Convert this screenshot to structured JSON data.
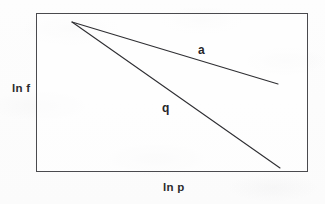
{
  "figure": {
    "type": "line-diagram",
    "background_color": "#fdfdfd",
    "frame_color": "#4a4a4e",
    "line_color": "#2e2e32"
  },
  "axes": {
    "y_label": "ln f",
    "x_label": "ln p"
  },
  "chart_data": {
    "type": "line",
    "title": "",
    "xlabel": "ln p",
    "ylabel": "ln f",
    "grid": false,
    "legend": "inline-labels",
    "axis_ticks": false,
    "frame": {
      "x0": 36,
      "y0": 13,
      "x1": 308,
      "y1": 172
    },
    "series": [
      {
        "name": "a",
        "label": "a",
        "label_position": {
          "x": 202,
          "y": 50
        },
        "points": [
          {
            "x": 72,
            "y": 22
          },
          {
            "x": 278,
            "y": 84
          }
        ],
        "slope_description": "shallow negative"
      },
      {
        "name": "q",
        "label": "q",
        "label_position": {
          "x": 168,
          "y": 108
        },
        "points": [
          {
            "x": 72,
            "y": 22
          },
          {
            "x": 280,
            "y": 168
          }
        ],
        "slope_description": "steep negative"
      }
    ]
  }
}
